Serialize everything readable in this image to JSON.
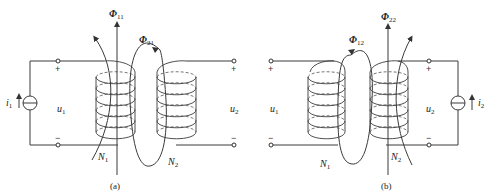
{
  "figure_a": {
    "caption": "(a)",
    "flux_self": {
      "symbol": "Φ",
      "sub": "11"
    },
    "flux_mutual": {
      "symbol": "Φ",
      "sub": "21"
    },
    "current": {
      "symbol": "i",
      "sub": "1"
    },
    "voltage_left": {
      "symbol": "u",
      "sub": "1"
    },
    "voltage_right": {
      "symbol": "u",
      "sub": "2"
    },
    "coil_left": {
      "symbol": "N",
      "sub": "1"
    },
    "coil_right": {
      "symbol": "N",
      "sub": "2"
    },
    "plus": "+",
    "minus": "−"
  },
  "figure_b": {
    "caption": "(b)",
    "flux_self": {
      "symbol": "Φ",
      "sub": "22"
    },
    "flux_mutual": {
      "symbol": "Φ",
      "sub": "12"
    },
    "current": {
      "symbol": "i",
      "sub": "2"
    },
    "voltage_left": {
      "symbol": "u",
      "sub": "1"
    },
    "voltage_right": {
      "symbol": "u",
      "sub": "2"
    },
    "coil_left": {
      "symbol": "N",
      "sub": "1"
    },
    "coil_right": {
      "symbol": "N",
      "sub": "2"
    },
    "plus": "+",
    "minus": "−"
  }
}
